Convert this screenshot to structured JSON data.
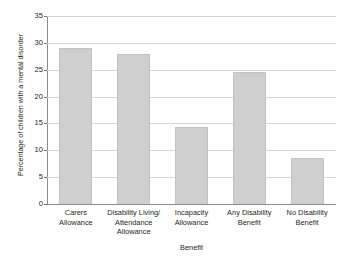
{
  "chart_data": {
    "type": "bar",
    "title": "",
    "xlabel": "Benefit",
    "ylabel": "Percentage of children with a mental disorder",
    "categories": [
      "Carers Allowance",
      "Disability Living/ Attendance Allowance",
      "Incapacity Allowance",
      "Any Disability Benefit",
      "No Disability Benefit"
    ],
    "category_lines": [
      [
        "Carers",
        "Allowance"
      ],
      [
        "Disability Living/",
        "Attendance",
        "Allowance"
      ],
      [
        "Incapacity",
        "Allowance"
      ],
      [
        "Any Disability",
        "Benefit"
      ],
      [
        "No Disability",
        "Benefit"
      ]
    ],
    "values": [
      29.0,
      28.0,
      14.4,
      24.6,
      8.6
    ],
    "ylim": [
      0,
      35
    ],
    "yticks": [
      0,
      5,
      10,
      15,
      20,
      25,
      30,
      35
    ],
    "ytick_labels": [
      "0",
      "5",
      "10",
      "15",
      "20",
      "25",
      "30",
      "35"
    ],
    "grid": true,
    "legend": false,
    "bar_color": "#cfcfcf",
    "bar_edge_color": "#c2c2c2",
    "grid_color": "#d6d6d6",
    "axis_color": "#8c8c8c",
    "text_color": "#231f20",
    "background": "#ffffff"
  }
}
